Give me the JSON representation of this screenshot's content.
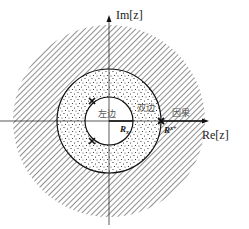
{
  "diagram": {
    "type": "z-plane region of convergence",
    "axes": {
      "imag_label": "Im[z]",
      "real_label": "Re[z]"
    },
    "regions": [
      {
        "name": "left-sided",
        "label": "左边",
        "fill": "blank",
        "description": "|z| < R_x-"
      },
      {
        "name": "two-sided",
        "label": "双边",
        "fill": "dotted",
        "description": "R_x- < |z| < R_x+"
      },
      {
        "name": "causal",
        "label": "因果",
        "fill": "hatched",
        "description": "|z| > R_x+"
      }
    ],
    "radii": [
      {
        "name": "inner",
        "label": "R",
        "subscript": "x-"
      },
      {
        "name": "outer",
        "label": "R",
        "subscript": "x+"
      }
    ],
    "poles": [
      {
        "position": "upper-left on inner circle"
      },
      {
        "position": "lower-left on inner circle"
      },
      {
        "position": "on positive real axis at outer circle"
      }
    ],
    "colors": {
      "line": "#111111",
      "hatch": "#333333",
      "dots": "#222222",
      "text_cn": "#555555"
    }
  }
}
